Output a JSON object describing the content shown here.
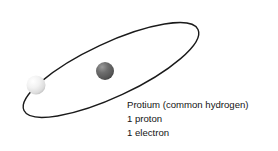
{
  "diagram": {
    "background_color": "#ffffff",
    "orbit": {
      "name": "electron-orbit",
      "stroke_color": "#1a1a1a",
      "stroke_width": 1.4,
      "center_x": 111,
      "center_y": 70,
      "radius_x": 96,
      "radius_y": 27,
      "rotation_deg": -25
    },
    "particles": [
      {
        "name": "electron",
        "label": "electron",
        "center_x": 36,
        "center_y": 85,
        "radius": 9.5,
        "fill_light": "#ffffff",
        "fill_mid": "#ededed",
        "fill_edge": "#c2c2c2"
      },
      {
        "name": "proton",
        "label": "proton",
        "center_x": 105,
        "center_y": 71,
        "radius": 9,
        "fill_light": "#8c8c8c",
        "fill_mid": "#5e5e5e",
        "fill_edge": "#3d3d3d"
      }
    ]
  },
  "caption": {
    "lines": [
      "Protium (common hydrogen)",
      "1 proton",
      "1 electron"
    ],
    "text_color": "#141414"
  }
}
